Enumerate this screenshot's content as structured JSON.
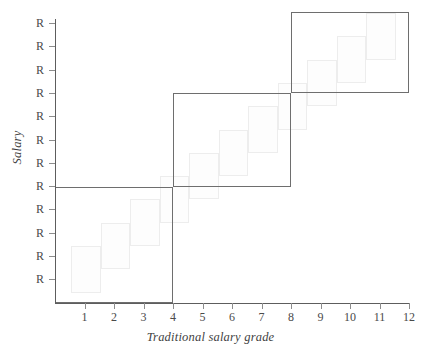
{
  "chart_data": {
    "type": "area",
    "title": "",
    "xlabel": "Traditional salary grade",
    "ylabel": "Salary",
    "xlim": [
      0,
      12
    ],
    "ylim": [
      0,
      12
    ],
    "grid": false,
    "legend": null,
    "x_tick_labels": [
      "1",
      "2",
      "3",
      "4",
      "5",
      "6",
      "7",
      "8",
      "9",
      "10",
      "11",
      "12"
    ],
    "x_tick_values": [
      1,
      2,
      3,
      4,
      5,
      6,
      7,
      8,
      9,
      10,
      11,
      12
    ],
    "y_tick_labels": [
      "R",
      "R",
      "R",
      "R",
      "R",
      "R",
      "R",
      "R",
      "R",
      "R",
      "R",
      "R"
    ],
    "y_tick_values": [
      1,
      2,
      3,
      4,
      5,
      6,
      7,
      8,
      9,
      10,
      11,
      12
    ],
    "series": [
      {
        "name": "Traditional salary grade ranges",
        "style": "light-grey-overlapping-boxes",
        "note": "Each traditional grade is a narrow salary range box one grade wide, stepping upward; adjacent ranges overlap vertically.",
        "boxes": [
          {
            "grade": 1,
            "x_start": 0.55,
            "x_end": 1.55,
            "y_bottom": 0.45,
            "y_top": 2.45
          },
          {
            "grade": 2,
            "x_start": 1.55,
            "x_end": 2.55,
            "y_bottom": 1.45,
            "y_top": 3.45
          },
          {
            "grade": 3,
            "x_start": 2.55,
            "x_end": 3.55,
            "y_bottom": 2.45,
            "y_top": 4.45
          },
          {
            "grade": 4,
            "x_start": 3.55,
            "x_end": 4.55,
            "y_bottom": 3.45,
            "y_top": 5.45
          },
          {
            "grade": 5,
            "x_start": 4.55,
            "x_end": 5.55,
            "y_bottom": 4.45,
            "y_top": 6.45
          },
          {
            "grade": 6,
            "x_start": 5.55,
            "x_end": 6.55,
            "y_bottom": 5.45,
            "y_top": 7.45
          },
          {
            "grade": 7,
            "x_start": 6.55,
            "x_end": 7.55,
            "y_bottom": 6.45,
            "y_top": 8.45
          },
          {
            "grade": 8,
            "x_start": 7.55,
            "x_end": 8.55,
            "y_bottom": 7.45,
            "y_top": 9.45
          },
          {
            "grade": 9,
            "x_start": 8.55,
            "x_end": 9.55,
            "y_bottom": 8.45,
            "y_top": 10.45
          },
          {
            "grade": 10,
            "x_start": 9.55,
            "x_end": 10.55,
            "y_bottom": 9.45,
            "y_top": 11.45
          },
          {
            "grade": 11,
            "x_start": 10.55,
            "x_end": 11.55,
            "y_bottom": 10.45,
            "y_top": 12.45
          }
        ]
      },
      {
        "name": "Broadbands",
        "style": "dark-outlined-rectangles",
        "note": "Three wide bands each spanning four traditional grades, overlaying the staircase.",
        "boxes": [
          {
            "band": 1,
            "x_start": 0.0,
            "x_end": 4.0,
            "y_bottom": 0.0,
            "y_top": 5.0
          },
          {
            "band": 2,
            "x_start": 4.0,
            "x_end": 8.0,
            "y_bottom": 5.0,
            "y_top": 9.0
          },
          {
            "band": 3,
            "x_start": 8.0,
            "x_end": 12.0,
            "y_bottom": 9.0,
            "y_top": 12.5
          }
        ]
      }
    ]
  },
  "colors": {
    "axis": "#5d5d5d",
    "tick": "#8d8d8d",
    "text": "#4a4a4a",
    "band_outline": "#6e6e6e",
    "step_fill": "#fdfdfd",
    "step_outline": "#ededed",
    "background": "#ffffff"
  }
}
